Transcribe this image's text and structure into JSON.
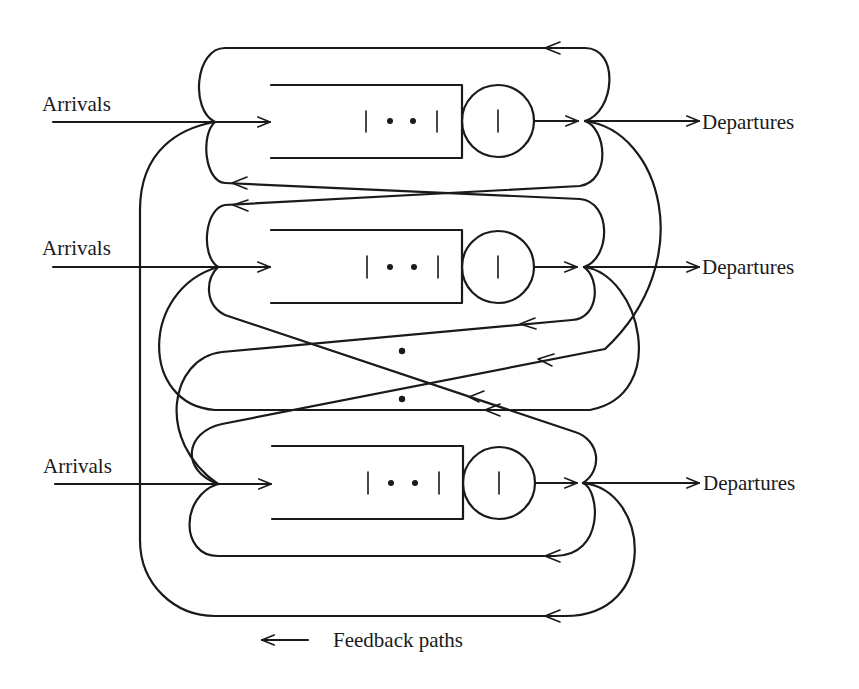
{
  "diagram": {
    "type": "queueing-network",
    "stations": [
      {
        "id": "station-1",
        "arrival_label": "Arrivals",
        "departure_label": "Departures",
        "queue_symbol": "| • • |",
        "server_symbol": "|"
      },
      {
        "id": "station-2",
        "arrival_label": "Arrivals",
        "departure_label": "Departures",
        "queue_symbol": "| • • |",
        "server_symbol": "|"
      },
      {
        "id": "station-3",
        "arrival_label": "Arrivals",
        "departure_label": "Departures",
        "queue_symbol": "| • • |",
        "server_symbol": "|"
      }
    ],
    "ellipsis": "• •",
    "legend": {
      "arrow": "←",
      "label": "Feedback paths"
    },
    "colors": {
      "line": "#1a1a1a",
      "background": "#ffffff"
    }
  }
}
